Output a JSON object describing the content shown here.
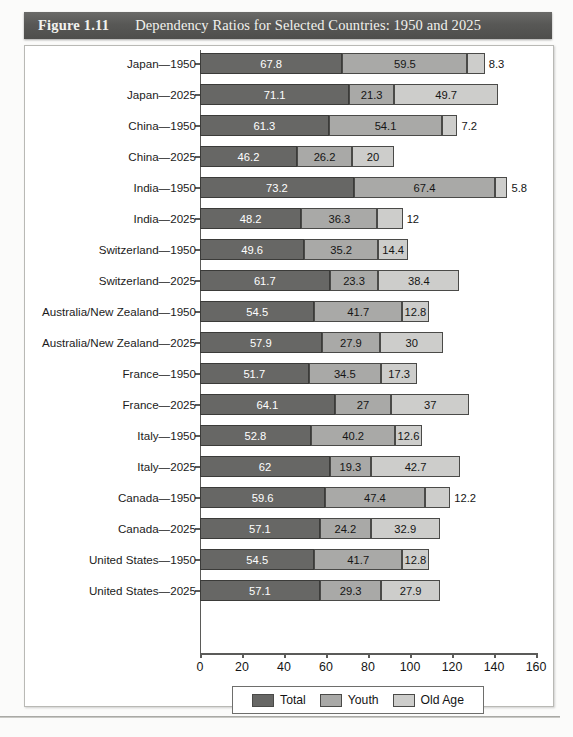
{
  "figure": {
    "number": "Figure 1.11",
    "title": "Dependency Ratios for Selected Countries: 1950 and 2025"
  },
  "colors": {
    "titlebar": "#585856",
    "total": "#676765",
    "youth": "#a9a9a7",
    "old_age": "#cdcdcb"
  },
  "chart_data": {
    "type": "bar",
    "orientation": "horizontal",
    "title": "Dependency Ratios for Selected Countries: 1950 and 2025",
    "xlabel": "",
    "ylabel": "",
    "xlim": [
      0,
      160
    ],
    "xticks": [
      0,
      20,
      40,
      60,
      80,
      100,
      120,
      140,
      160
    ],
    "grid": false,
    "legend_position": "bottom",
    "stacked": true,
    "categories": [
      "Japan—1950",
      "Japan—2025",
      "China—1950",
      "China—2025",
      "India—1950",
      "India—2025",
      "Switzerland—1950",
      "Switzerland—2025",
      "Australia/New Zealand—1950",
      "Australia/New Zealand—2025",
      "France—1950",
      "France—2025",
      "Italy—1950",
      "Italy—2025",
      "Canada—1950",
      "Canada—2025",
      "United States—1950",
      "United States—2025"
    ],
    "series": [
      {
        "name": "Total",
        "values": [
          67.8,
          71.1,
          61.3,
          46.2,
          73.2,
          48.2,
          49.6,
          61.7,
          54.5,
          57.9,
          51.7,
          64.1,
          52.8,
          62,
          59.6,
          57.1,
          54.5,
          57.1
        ]
      },
      {
        "name": "Youth",
        "values": [
          59.5,
          21.3,
          54.1,
          26.2,
          67.4,
          36.3,
          35.2,
          23.3,
          41.7,
          27.9,
          34.5,
          27,
          40.2,
          19.3,
          47.4,
          24.2,
          41.7,
          29.3
        ]
      },
      {
        "name": "Old Age",
        "values": [
          8.3,
          49.7,
          7.2,
          20,
          5.8,
          12,
          14.4,
          38.4,
          12.8,
          30,
          17.3,
          37,
          12.6,
          42.7,
          12.2,
          32.9,
          12.8,
          27.9
        ]
      }
    ],
    "rows": [
      {
        "label": "Japan—1950",
        "total": "67.8",
        "youth": "59.5",
        "old": "8.3"
      },
      {
        "label": "Japan—2025",
        "total": "71.1",
        "youth": "21.3",
        "old": "49.7"
      },
      {
        "label": "China—1950",
        "total": "61.3",
        "youth": "54.1",
        "old": "7.2"
      },
      {
        "label": "China—2025",
        "total": "46.2",
        "youth": "26.2",
        "old": "20"
      },
      {
        "label": "India—1950",
        "total": "73.2",
        "youth": "67.4",
        "old": "5.8"
      },
      {
        "label": "India—2025",
        "total": "48.2",
        "youth": "36.3",
        "old": "12"
      },
      {
        "label": "Switzerland—1950",
        "total": "49.6",
        "youth": "35.2",
        "old": "14.4"
      },
      {
        "label": "Switzerland—2025",
        "total": "61.7",
        "youth": "23.3",
        "old": "38.4"
      },
      {
        "label": "Australia/New Zealand—1950",
        "total": "54.5",
        "youth": "41.7",
        "old": "12.8"
      },
      {
        "label": "Australia/New Zealand—2025",
        "total": "57.9",
        "youth": "27.9",
        "old": "30"
      },
      {
        "label": "France—1950",
        "total": "51.7",
        "youth": "34.5",
        "old": "17.3"
      },
      {
        "label": "France—2025",
        "total": "64.1",
        "youth": "27",
        "old": "37"
      },
      {
        "label": "Italy—1950",
        "total": "52.8",
        "youth": "40.2",
        "old": "12.6"
      },
      {
        "label": "Italy—2025",
        "total": "62",
        "youth": "19.3",
        "old": "42.7"
      },
      {
        "label": "Canada—1950",
        "total": "59.6",
        "youth": "47.4",
        "old": "12.2"
      },
      {
        "label": "Canada—2025",
        "total": "57.1",
        "youth": "24.2",
        "old": "32.9"
      },
      {
        "label": "United States—1950",
        "total": "54.5",
        "youth": "41.7",
        "old": "12.8"
      },
      {
        "label": "United States—2025",
        "total": "57.1",
        "youth": "29.3",
        "old": "27.9"
      }
    ],
    "legend": [
      {
        "label": "Total",
        "color": "#676765"
      },
      {
        "label": "Youth",
        "color": "#a9a9a7"
      },
      {
        "label": "Old Age",
        "color": "#cdcdcb"
      }
    ]
  }
}
